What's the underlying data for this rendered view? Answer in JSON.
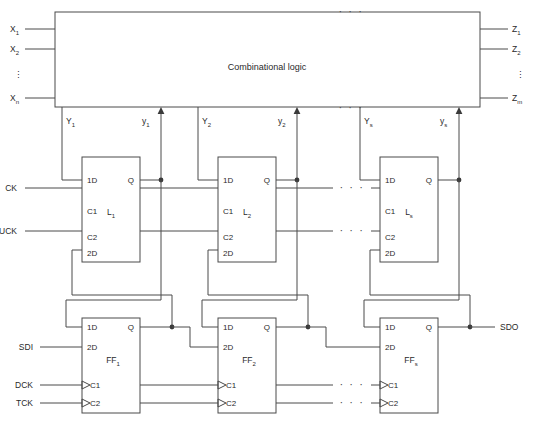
{
  "figure": {
    "kind": "logic-diagram"
  },
  "comb_block": {
    "title": "Combinational logic",
    "top_ellipsis": "· · ·",
    "bottom_ellipsis": "· · ·"
  },
  "primary_inputs": {
    "items": [
      {
        "base": "X",
        "sub": "1"
      },
      {
        "base": "X",
        "sub": "2"
      },
      {
        "base": "X",
        "sub": "n"
      }
    ],
    "vertical_ellipsis": "⋮"
  },
  "primary_outputs": {
    "items": [
      {
        "base": "Z",
        "sub": "1"
      },
      {
        "base": "Z",
        "sub": "2"
      },
      {
        "base": "Z",
        "sub": "m"
      }
    ],
    "vertical_ellipsis": "⋮"
  },
  "state_signals": {
    "next_state": [
      {
        "base": "Y",
        "sub": "1"
      },
      {
        "base": "Y",
        "sub": "2"
      },
      {
        "base": "Y",
        "sub": "s"
      }
    ],
    "present_state": [
      {
        "base": "y",
        "sub": "1"
      },
      {
        "base": "y",
        "sub": "2"
      },
      {
        "base": "y",
        "sub": "s"
      }
    ]
  },
  "latches": {
    "pins_left": [
      "1D",
      "C1",
      "C2",
      "2D"
    ],
    "pin_right": "Q",
    "stages": [
      {
        "base": "L",
        "sub": "1"
      },
      {
        "base": "L",
        "sub": "2"
      },
      {
        "base": "L",
        "sub": "s"
      }
    ]
  },
  "flipflops": {
    "pins_left": [
      "1D",
      "2D",
      "C1",
      "C2"
    ],
    "pin_right": "Q",
    "stages": [
      {
        "base": "FF",
        "sub": "1"
      },
      {
        "base": "FF",
        "sub": "2"
      },
      {
        "base": "FF",
        "sub": "s"
      }
    ]
  },
  "control_inputs": {
    "latch_clock": "CK",
    "update_clock": "UCK",
    "scan_data_in": "SDI",
    "data_clock": "DCK",
    "test_clock": "TCK"
  },
  "control_outputs": {
    "scan_data_out": "SDO"
  },
  "ellipses": {
    "horizontal": "· · ·"
  },
  "colors": {
    "wire": "#4a4a4a",
    "text": "#2a2a2a",
    "background": "#ffffff"
  }
}
